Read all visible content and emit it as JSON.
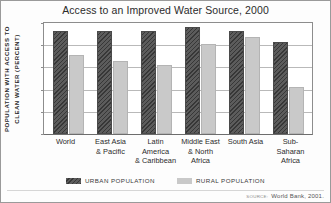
{
  "chart_data": {
    "type": "bar",
    "title": "Access to an Improved Water Source, 2000",
    "xlabel": "",
    "ylabel_line1": "POPULATION WITH ACCESS TO",
    "ylabel_line2": "CLEAN WATER (PERCENT)",
    "ylim": [
      0,
      100
    ],
    "yticks": [
      100,
      80,
      60,
      40,
      20,
      0
    ],
    "grid": true,
    "legend_position": "bottom",
    "categories": [
      "World",
      "East Asia\n& Pacific",
      "Latin\nAmerica\n& Caribbean",
      "Middle East\n& North\nAfrica",
      "South Asia",
      "Sub-\nSaharan\nAfrica"
    ],
    "series": [
      {
        "name": "URBAN POPULATION",
        "color": "#5c5c5c",
        "values": [
          93,
          93,
          93,
          96,
          93,
          83
        ]
      },
      {
        "name": "RURAL POPULATION",
        "color": "#c9c9c9",
        "values": [
          71,
          66,
          62,
          81,
          87,
          42
        ]
      }
    ],
    "source_prefix": "SOURCE:",
    "source": "World Bank, 2001."
  }
}
